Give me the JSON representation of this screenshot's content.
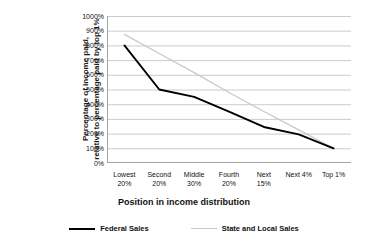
{
  "chart_data": {
    "type": "line",
    "title": "",
    "xlabel": "Position in income distribution",
    "ylabel_line1": "Percentage of income paid,",
    "ylabel_line2": "relative to percentage paid by top 1%",
    "categories": [
      "Lowest 20%",
      "Second 20%",
      "Middle 30%",
      "Fourth 20%",
      "Next 15%",
      "Next 4%",
      "Top 1%"
    ],
    "categories_split": [
      {
        "line1": "Lowest",
        "line2": "20%"
      },
      {
        "line1": "Second",
        "line2": "20%"
      },
      {
        "line1": "Middle",
        "line2": "30%"
      },
      {
        "line1": "Fourth",
        "line2": "20%"
      },
      {
        "line1": "Next",
        "line2": "15%"
      },
      {
        "line1": "Next 4%",
        "line2": ""
      },
      {
        "line1": "Top 1%",
        "line2": ""
      }
    ],
    "series": [
      {
        "name": "Federal Sales",
        "color": "#000000",
        "values": [
          800,
          500,
          450,
          350,
          245,
          195,
          100
        ]
      },
      {
        "name": "State and Local Sales",
        "color": "#c9c9c9",
        "values": [
          875,
          745,
          615,
          480,
          350,
          225,
          100
        ]
      }
    ],
    "ylim": [
      0,
      1000
    ],
    "ytick_values": [
      1000,
      900,
      800,
      700,
      600,
      500,
      400,
      300,
      200,
      100,
      0
    ],
    "ytick_labels": [
      "1000%",
      "900%",
      "800%",
      "700%",
      "600%",
      "500%",
      "400%",
      "300%",
      "200%",
      "100%",
      "0%"
    ],
    "grid": true,
    "grid_color": "#bfbfbf",
    "legend_position": "bottom"
  },
  "legend": {
    "items": [
      {
        "label": "Federal Sales",
        "swatch": "federal"
      },
      {
        "label": "State and Local Sales",
        "swatch": "statelocal"
      }
    ]
  }
}
